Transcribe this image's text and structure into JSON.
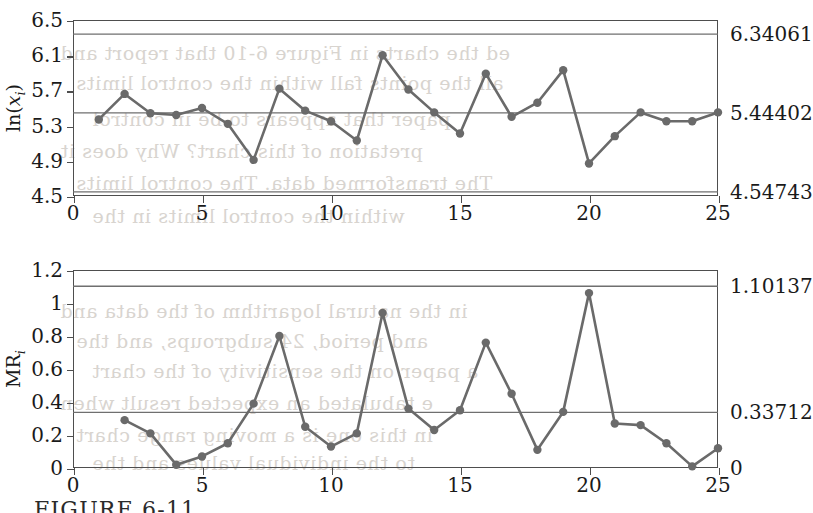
{
  "figure": {
    "caption": "FIGURE 6-11",
    "bleed_text": [
      "ed the charts in Figure 6-10 that report and",
      "all the points fall within the control limits",
      "paper that appears to be in control",
      "pretation of this chart? Why does it",
      "The transformed data. The control limits",
      "within the control limits in the",
      "in the natural logarithm of the data and",
      "and period, 24 subgroups, and the",
      "a paper on the sensitivity of the chart",
      "e tabulated an expected result when",
      "in this one is a moving range chart",
      "to the individual values and the"
    ]
  },
  "chart_data": [
    {
      "type": "line",
      "id": "individuals-chart",
      "title": "",
      "ylabel": "ln(x_i)",
      "xlabel": "",
      "xlim": [
        0,
        25
      ],
      "ylim": [
        4.5,
        6.5
      ],
      "yticks": [
        "4.5",
        "4.9",
        "5.3",
        "5.7",
        "6.1",
        "6.5"
      ],
      "ytick_values": [
        4.5,
        4.9,
        5.3,
        5.7,
        6.1,
        6.5
      ],
      "xticks": [
        "0",
        "5",
        "10",
        "15",
        "20",
        "25"
      ],
      "xtick_values": [
        0,
        5,
        10,
        15,
        20,
        25
      ],
      "grid": false,
      "limits": [
        {
          "name": "UCL",
          "label": "6.34061",
          "value": 6.34061
        },
        {
          "name": "CL",
          "label": "5.44402",
          "value": 5.44402
        },
        {
          "name": "LCL",
          "label": "4.54743",
          "value": 4.54743
        }
      ],
      "x": [
        1,
        2,
        3,
        4,
        5,
        6,
        7,
        8,
        9,
        10,
        11,
        12,
        13,
        14,
        15,
        16,
        17,
        18,
        19,
        20,
        21,
        22,
        23,
        24,
        25
      ],
      "values": [
        5.37,
        5.66,
        5.44,
        5.42,
        5.5,
        5.32,
        4.91,
        5.72,
        5.47,
        5.35,
        5.13,
        6.1,
        5.71,
        5.45,
        5.21,
        5.89,
        5.4,
        5.56,
        5.93,
        4.87,
        5.18,
        5.45,
        5.35,
        5.35,
        5.45
      ]
    },
    {
      "type": "line",
      "id": "moving-range-chart",
      "title": "",
      "ylabel": "MR_i",
      "xlabel": "",
      "xlim": [
        0,
        25
      ],
      "ylim": [
        0,
        1.2
      ],
      "yticks": [
        "0",
        "0.2",
        "0.4",
        "0.6",
        "0.8",
        "1",
        "1.2"
      ],
      "ytick_values": [
        0,
        0.2,
        0.4,
        0.6,
        0.8,
        1,
        1.2
      ],
      "xticks": [
        "0",
        "5",
        "10",
        "15",
        "20",
        "25"
      ],
      "xtick_values": [
        0,
        5,
        10,
        15,
        20,
        25
      ],
      "grid": false,
      "limits": [
        {
          "name": "UCL",
          "label": "1.10137",
          "value": 1.10137
        },
        {
          "name": "CL",
          "label": "0.33712",
          "value": 0.33712
        },
        {
          "name": "LCL",
          "label": "0",
          "value": 0
        }
      ],
      "x": [
        2,
        3,
        4,
        5,
        6,
        7,
        8,
        9,
        10,
        11,
        12,
        13,
        14,
        15,
        16,
        17,
        18,
        19,
        20,
        21,
        22,
        23,
        24,
        25
      ],
      "values": [
        0.29,
        0.21,
        0.02,
        0.07,
        0.15,
        0.39,
        0.8,
        0.25,
        0.13,
        0.21,
        0.94,
        0.36,
        0.23,
        0.35,
        0.76,
        0.45,
        0.11,
        0.34,
        1.06,
        0.27,
        0.26,
        0.15,
        0.01,
        0.12
      ]
    }
  ]
}
